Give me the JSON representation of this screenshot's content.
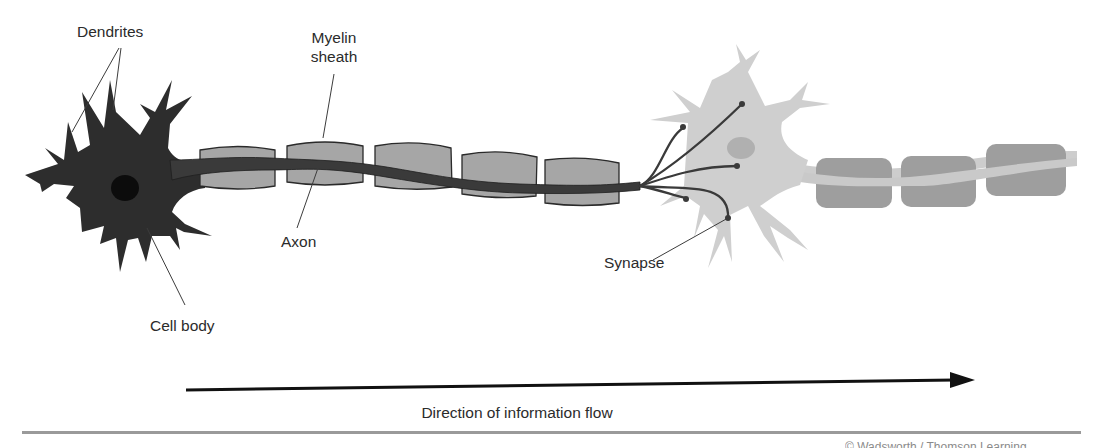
{
  "diagram": {
    "labels": {
      "dendrites": "Dendrites",
      "myelin_sheath_line1": "Myelin",
      "myelin_sheath_line2": "sheath",
      "axon": "Axon",
      "synapse": "Synapse",
      "cell_body": "Cell body"
    },
    "flow_caption": "Direction of information flow",
    "credit_fragment": "© Wadsworth / Thomson Learning",
    "colors": {
      "presynaptic_neuron": "#2e2e2e",
      "postsynaptic_neuron": "#cfcfcf",
      "myelin_front": "#a5a5a5",
      "myelin_back": "#9c9c9c",
      "nucleus_dark": "#0e0e0e",
      "nucleus_light": "#b3b3b3",
      "arrow": "#111111",
      "rule": "#9a9a9a",
      "leader_lines": "#444444"
    },
    "components": [
      {
        "name": "Dendrites",
        "neuron": "presynaptic"
      },
      {
        "name": "Cell body",
        "neuron": "presynaptic"
      },
      {
        "name": "Axon",
        "neuron": "presynaptic"
      },
      {
        "name": "Myelin sheath",
        "segments_presynaptic": 5,
        "segments_postsynaptic": 3
      },
      {
        "name": "Synapse",
        "terminal_branches": 6
      }
    ]
  }
}
